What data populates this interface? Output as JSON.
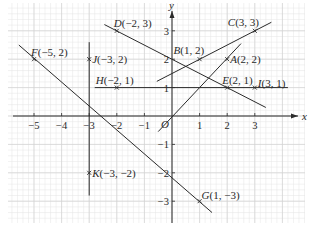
{
  "figure": {
    "type": "coordinate-plane",
    "axes": {
      "x_label": "x",
      "y_label": "y",
      "origin_label": "O",
      "x_ticks": [
        -5,
        -4,
        -3,
        -2,
        -1,
        1,
        2,
        3
      ],
      "y_ticks": [
        -3,
        -2,
        -1,
        1,
        2,
        3
      ],
      "x_tick_labels": [
        "−5",
        "−4",
        "−3",
        "−2",
        "−1",
        "1",
        "2",
        "3"
      ],
      "y_tick_labels": [
        "−3",
        "−2",
        "−1",
        "1",
        "2",
        "3"
      ]
    },
    "points": [
      {
        "name": "A",
        "x": 2,
        "y": 2,
        "label": "A(2, 2)"
      },
      {
        "name": "B",
        "x": 1,
        "y": 2,
        "label": "B(1, 2)"
      },
      {
        "name": "C",
        "x": 3,
        "y": 3,
        "label": "C(3, 3)"
      },
      {
        "name": "D",
        "x": -2,
        "y": 3,
        "label": "D(−2, 3)"
      },
      {
        "name": "E",
        "x": 2,
        "y": 1,
        "label": "E(2, 1)"
      },
      {
        "name": "F",
        "x": -5,
        "y": 2,
        "label": "F(−5, 2)"
      },
      {
        "name": "G",
        "x": 1,
        "y": -3,
        "label": "G(1, −3)"
      },
      {
        "name": "H",
        "x": -2,
        "y": 1,
        "label": "H(−2, 1)"
      },
      {
        "name": "I",
        "x": 3,
        "y": 1,
        "label": "I(3, 1)"
      },
      {
        "name": "J",
        "x": -3,
        "y": 2,
        "label": "J(−3, 2)"
      },
      {
        "name": "K",
        "x": -3,
        "y": -2,
        "label": "K(−3, −2)"
      }
    ],
    "lines": [
      {
        "name": "line-OA",
        "through": [
          "O",
          "A"
        ],
        "from": [
          -0.5,
          -0.55
        ],
        "to": [
          2.5,
          2.55
        ]
      },
      {
        "name": "line-BC",
        "through": [
          "B",
          "C"
        ],
        "from": [
          -0.55,
          1.22
        ],
        "to": [
          3.6,
          3.3
        ]
      },
      {
        "name": "line-DE",
        "through": [
          "D",
          "E"
        ],
        "from": [
          -2.45,
          3.22
        ],
        "to": [
          3.4,
          0.3
        ]
      },
      {
        "name": "line-HI",
        "through": [
          "H",
          "I"
        ],
        "from": [
          -2.8,
          1
        ],
        "to": [
          4.2,
          1
        ]
      },
      {
        "name": "line-JK",
        "through": [
          "J",
          "K"
        ],
        "from": [
          -3,
          2.6
        ],
        "to": [
          -3,
          -2.8
        ]
      },
      {
        "name": "line-FG",
        "through": [
          "F",
          "G"
        ],
        "from": [
          -5.55,
          2.5
        ],
        "to": [
          1.45,
          -3.4
        ]
      }
    ],
    "colors": {
      "background": "#ffffff",
      "grid_minor": "#e4e4e4",
      "grid_major": "#d2d2d2",
      "ink": "#2a2a2a"
    }
  }
}
